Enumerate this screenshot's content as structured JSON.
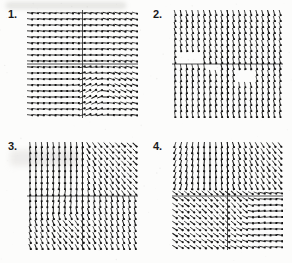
{
  "figure": {
    "kind": "direction-field-multiple-choice-figure",
    "background_color": "#fcfcfb",
    "ink_color": "#141414",
    "axis_color": "#3a3a3a",
    "panel_count": 4
  },
  "panels": [
    {
      "id": "panel-1",
      "label": "1.",
      "label_x": 8,
      "label_y": 9,
      "plot_x": 27,
      "plot_y": 10,
      "plot_w": 111,
      "plot_h": 108,
      "axis_x_frac": 0.5,
      "axis_y_frac": 0.5,
      "cols": 19,
      "rows": 18,
      "seg_len": 6.2,
      "field_type": "spiral-saddle",
      "chart_data": {
        "type": "quiver",
        "title": "1.",
        "xlabel": "",
        "ylabel": "",
        "xlim": [
          -1,
          1
        ],
        "ylim": [
          -1,
          1
        ],
        "grid": false,
        "axes_shown": [
          "x-axis",
          "y-axis"
        ],
        "angle_model": "swirl-right-lower",
        "notes": "Arrows nearly horizontal pointing right across most of the plane; a clockwise vortex / swirl center sits in the lower-right quadrant near x=0.35,y=-0.35; upper-left arrows tilt steeply downward-right."
      }
    },
    {
      "id": "panel-2",
      "label": "2.",
      "label_x": 153,
      "label_y": 9,
      "plot_x": 172,
      "plot_y": 10,
      "plot_w": 111,
      "plot_h": 108,
      "axis_x_frac": 0.5,
      "axis_y_frac": 0.5,
      "cols": 19,
      "rows": 18,
      "seg_len": 6.2,
      "field_type": "near-vertical",
      "chart_data": {
        "type": "quiver",
        "title": "2.",
        "xlabel": "",
        "ylabel": "",
        "xlim": [
          -1,
          1
        ],
        "ylim": [
          -1,
          1
        ],
        "grid": false,
        "axes_shown": [
          "x-axis",
          "y-axis"
        ],
        "angle_model": "steep-uniform",
        "notes": "Nearly uniform field of steep, almost vertical strokes leaning to the right everywhere; two small blank gaps appear just above and just below the x-axis on the left-of-center and right-of-center regions."
      }
    },
    {
      "id": "panel-3",
      "label": "3.",
      "label_x": 8,
      "label_y": 141,
      "plot_x": 27,
      "plot_y": 142,
      "plot_w": 111,
      "plot_h": 108,
      "axis_x_frac": 0.5,
      "axis_y_frac": 0.5,
      "cols": 19,
      "rows": 18,
      "seg_len": 6.2,
      "field_type": "saddle-vertical",
      "chart_data": {
        "type": "quiver",
        "title": "3.",
        "xlabel": "",
        "ylabel": "",
        "xlim": [
          -1,
          1
        ],
        "ylim": [
          -1,
          1
        ],
        "grid": false,
        "axes_shown": [
          "x-axis",
          "y-axis"
        ],
        "angle_model": "swirl-left-lower",
        "notes": "Arrows nearly vertical along the left and right edges; a counter-clockwise swirl center sits in the lower-left quadrant near x=-0.35,y=-0.35 and flow turns horizontal near the upper-right quadrant."
      }
    },
    {
      "id": "panel-4",
      "label": "4.",
      "label_x": 153,
      "label_y": 141,
      "plot_x": 172,
      "plot_y": 142,
      "plot_w": 111,
      "plot_h": 108,
      "axis_x_frac": 0.5,
      "axis_y_frac": 0.5,
      "cols": 19,
      "rows": 18,
      "seg_len": 6.2,
      "field_type": "source-sink",
      "chart_data": {
        "type": "quiver",
        "title": "4.",
        "xlabel": "",
        "ylabel": "",
        "xlim": [
          -1,
          1
        ],
        "ylim": [
          -1,
          1
        ],
        "grid": false,
        "axes_shown": [
          "x-axis",
          "y-axis"
        ],
        "angle_model": "vertical-upper-horizontal-lower",
        "notes": "Upper half shows steep, near vertical strokes fanning outward from the vertical axis; just above the x-axis the strokes flatten to horizontal; the lower half shows a second swirl with near-vertical strokes right of center and flattening strokes to the lower left."
      }
    }
  ]
}
